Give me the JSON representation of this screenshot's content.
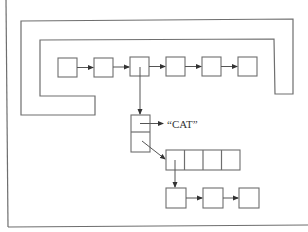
{
  "diagram": {
    "type": "data-structure",
    "frame": {
      "stroke": "#6e6e6e"
    },
    "top_list": {
      "description": "linked list of 6 nodes enclosed by a U-shaped boundary",
      "node_count": 6
    },
    "record_node": {
      "fields": 2,
      "field_0_points_to": "string",
      "field_1_points_to": "array"
    },
    "string_label": "“CAT”",
    "array": {
      "cells": 4
    },
    "bottom_list": {
      "node_count": 3
    }
  }
}
